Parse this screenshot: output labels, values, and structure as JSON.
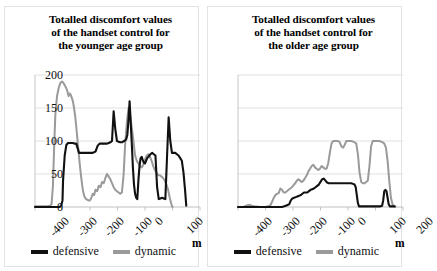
{
  "figure": {
    "background": "#ffffff",
    "panel_border_color": "#e3e3e3"
  },
  "colors": {
    "defensive": "#111111",
    "dynamic": "#9a9a9a",
    "gridline": "#d9d9d9",
    "axis": "#bfbfbf",
    "text": "#111111"
  },
  "legend": {
    "defensive_label": "defensive",
    "dynamic_label": "dynamic"
  },
  "axis": {
    "unit_label": "m",
    "y_ticks": [
      "0",
      "50",
      "100",
      "150",
      "200"
    ],
    "x_ticks": [
      "-400",
      "-300",
      "-200",
      "-100",
      "0",
      "100",
      "200"
    ]
  },
  "chart_data": [
    {
      "type": "line",
      "id": "younger",
      "title": "Totalled discomfort values of the handset control for the younger age group",
      "title_lines": [
        "Totalled discomfort values",
        "of the handset control for",
        "the younger age group"
      ],
      "xlabel": "m",
      "ylabel": "",
      "xlim": [
        -400,
        200
      ],
      "ylim": [
        0,
        200
      ],
      "xticks": [
        -400,
        -300,
        -200,
        -100,
        0,
        100,
        200
      ],
      "yticks": [
        0,
        50,
        100,
        150,
        200
      ],
      "grid": true,
      "legend_position": "bottom",
      "series": [
        {
          "name": "defensive",
          "color": "#111111",
          "x": [
            -400,
            -350,
            -320,
            -310,
            -305,
            -300,
            -298,
            -292,
            -286,
            -280,
            -270,
            -262,
            -255,
            -250,
            -240,
            -230,
            -220,
            -210,
            -200,
            -190,
            -180,
            -172,
            -165,
            -160,
            -152,
            -148,
            -142,
            -138,
            -132,
            -126,
            -120,
            -114,
            -108,
            -102,
            -96,
            -90,
            -84,
            -80,
            -76,
            -72,
            -68,
            -64,
            -60,
            -56,
            -52,
            -48,
            -44,
            -40,
            -36,
            -32,
            -28,
            -24,
            -20,
            -16,
            -12,
            -8,
            -4,
            0,
            4,
            8,
            12,
            16,
            20,
            26,
            32,
            38,
            44,
            50,
            56,
            62,
            68,
            74,
            80,
            86,
            92,
            98,
            104,
            110,
            116,
            122,
            128,
            134,
            140,
            146,
            150
          ],
          "y": [
            0,
            0,
            0,
            0,
            2,
            10,
            40,
            78,
            94,
            97,
            97,
            97,
            96,
            96,
            82,
            82,
            82,
            82,
            82,
            82,
            84,
            93,
            96,
            96,
            96,
            96,
            96,
            96,
            97,
            98,
            100,
            145,
            118,
            100,
            99,
            98,
            98,
            99,
            100,
            101,
            103,
            110,
            132,
            160,
            128,
            96,
            60,
            34,
            20,
            14,
            12,
            40,
            62,
            74,
            76,
            71,
            67,
            66,
            70,
            74,
            76,
            78,
            80,
            82,
            80,
            78,
            30,
            12,
            13,
            14,
            13,
            12,
            75,
            136,
            100,
            82,
            82,
            82,
            80,
            78,
            74,
            70,
            52,
            24,
            2
          ]
        },
        {
          "name": "dynamic",
          "color": "#9a9a9a",
          "x": [
            -400,
            -370,
            -355,
            -345,
            -340,
            -335,
            -330,
            -326,
            -320,
            -314,
            -308,
            -302,
            -298,
            -294,
            -290,
            -286,
            -282,
            -278,
            -274,
            -270,
            -266,
            -262,
            -258,
            -254,
            -250,
            -246,
            -242,
            -238,
            -234,
            -230,
            -226,
            -222,
            -218,
            -214,
            -210,
            -205,
            -200,
            -195,
            -190,
            -185,
            -180,
            -174,
            -168,
            -162,
            -156,
            -150,
            -144,
            -138,
            -132,
            -126,
            -120,
            -114,
            -108,
            -102,
            -96,
            -90,
            -84,
            -78,
            -72,
            -66,
            -60,
            -54,
            -48,
            -42,
            -36,
            -30,
            -24,
            -18,
            -12,
            -6,
            0,
            6,
            12,
            18,
            24,
            30,
            36,
            42,
            48,
            54,
            60,
            66,
            72,
            78,
            84,
            90,
            96,
            100
          ],
          "y": [
            1,
            1,
            1,
            2,
            4,
            30,
            96,
            140,
            168,
            180,
            188,
            190,
            189,
            186,
            183,
            180,
            175,
            168,
            172,
            170,
            165,
            160,
            150,
            138,
            122,
            104,
            86,
            68,
            52,
            38,
            26,
            18,
            14,
            12,
            11,
            10,
            10,
            14,
            20,
            18,
            26,
            24,
            32,
            30,
            38,
            36,
            44,
            50,
            46,
            42,
            36,
            30,
            26,
            24,
            22,
            20,
            22,
            48,
            96,
            128,
            150,
            140,
            120,
            100,
            78,
            70,
            66,
            62,
            60,
            64,
            72,
            78,
            80,
            76,
            70,
            62,
            56,
            52,
            48,
            48,
            46,
            44,
            40,
            34,
            26,
            14,
            4,
            0
          ]
        }
      ]
    },
    {
      "type": "line",
      "id": "older",
      "title": "Totalled discomfort values of the handset control for the older age group",
      "title_lines": [
        "Totalled discomfort values",
        "of the handset control for",
        "the older age group"
      ],
      "xlabel": "m",
      "ylabel": "",
      "xlim": [
        -400,
        200
      ],
      "ylim": [
        0,
        200
      ],
      "xticks": [
        -400,
        -300,
        -200,
        -100,
        0,
        100,
        200
      ],
      "yticks": [
        0,
        50,
        100,
        150,
        200
      ],
      "grid": true,
      "legend_position": "bottom",
      "series": [
        {
          "name": "defensive",
          "color": "#111111",
          "x": [
            -400,
            -350,
            -300,
            -270,
            -250,
            -240,
            -232,
            -226,
            -220,
            -214,
            -208,
            -202,
            -196,
            -190,
            -184,
            -178,
            -172,
            -166,
            -160,
            -154,
            -148,
            -142,
            -136,
            -130,
            -124,
            -118,
            -112,
            -106,
            -100,
            -94,
            -88,
            -82,
            -76,
            -70,
            -64,
            -58,
            -52,
            -46,
            -40,
            -34,
            -28,
            -22,
            -16,
            -10,
            -4,
            0,
            6,
            12,
            18,
            24,
            28,
            32,
            36,
            40,
            48,
            56,
            64,
            72,
            80,
            90,
            100,
            110,
            118,
            124,
            128,
            132,
            136,
            140,
            144,
            148,
            152,
            160,
            170
          ],
          "y": [
            0,
            0,
            0,
            0,
            0,
            0,
            1,
            2,
            3,
            4,
            10,
            13,
            14,
            15,
            16,
            17,
            18,
            20,
            22,
            22,
            22,
            24,
            26,
            27,
            28,
            30,
            32,
            34,
            38,
            42,
            43,
            40,
            37,
            36,
            36,
            36,
            36,
            36,
            36,
            36,
            36,
            36,
            36,
            36,
            36,
            36,
            36,
            36,
            35,
            34,
            30,
            18,
            6,
            1,
            1,
            1,
            1,
            1,
            1,
            1,
            1,
            1,
            1,
            2,
            10,
            24,
            26,
            24,
            14,
            4,
            1,
            1,
            1
          ]
        },
        {
          "name": "dynamic",
          "color": "#9a9a9a",
          "x": [
            -400,
            -380,
            -370,
            -362,
            -356,
            -350,
            -340,
            -320,
            -300,
            -290,
            -282,
            -276,
            -270,
            -264,
            -258,
            -252,
            -246,
            -240,
            -234,
            -228,
            -222,
            -216,
            -210,
            -204,
            -198,
            -192,
            -186,
            -180,
            -174,
            -168,
            -162,
            -156,
            -150,
            -144,
            -138,
            -132,
            -126,
            -120,
            -114,
            -108,
            -102,
            -96,
            -90,
            -84,
            -78,
            -72,
            -66,
            -60,
            -54,
            -48,
            -42,
            -36,
            -30,
            -24,
            -18,
            -12,
            -6,
            0,
            6,
            12,
            18,
            24,
            30,
            36,
            42,
            48,
            54,
            60,
            66,
            72,
            78,
            84,
            90,
            96,
            102,
            108,
            114,
            120,
            126,
            132,
            138,
            144,
            150,
            156,
            162,
            168,
            172
          ],
          "y": [
            0,
            0,
            2,
            3,
            3,
            2,
            1,
            0,
            0,
            1,
            3,
            8,
            14,
            18,
            20,
            21,
            28,
            26,
            22,
            22,
            24,
            26,
            28,
            30,
            33,
            36,
            40,
            42,
            40,
            38,
            40,
            44,
            48,
            54,
            58,
            62,
            64,
            60,
            58,
            56,
            58,
            62,
            60,
            58,
            58,
            66,
            82,
            96,
            100,
            100,
            100,
            100,
            98,
            92,
            90,
            94,
            100,
            100,
            100,
            100,
            99,
            98,
            96,
            80,
            52,
            38,
            36,
            36,
            38,
            40,
            62,
            92,
            100,
            100,
            100,
            100,
            100,
            99,
            98,
            96,
            90,
            70,
            40,
            14,
            4,
            1,
            0
          ]
        }
      ]
    }
  ]
}
